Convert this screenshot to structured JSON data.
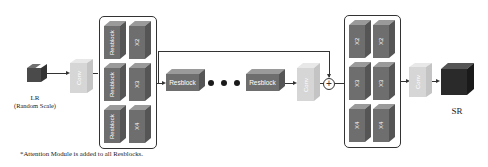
{
  "diagram": {
    "input": {
      "label": "LR",
      "sublabel": "(Random Scale)"
    },
    "head_conv": {
      "label": "Conv"
    },
    "left_group": {
      "rows": [
        {
          "block": "Resblock",
          "scale": "X2"
        },
        {
          "block": "Resblock",
          "scale": "X3"
        },
        {
          "block": "Resblock",
          "scale": "X4"
        }
      ]
    },
    "body": {
      "first_block": "Resblock",
      "last_block": "Resblock",
      "ellipsis_dots": 3,
      "conv": "Conv",
      "sum_symbol": "+"
    },
    "right_group": {
      "rows": [
        {
          "left": "X2",
          "right": "X2"
        },
        {
          "left": "X3",
          "right": "X3"
        },
        {
          "left": "X4",
          "right": "X4"
        }
      ]
    },
    "tail_conv": {
      "label": "Conv"
    },
    "output": {
      "label": "SR"
    },
    "footnote": "*Attention Module is added to all Resblocks."
  },
  "colors": {
    "block_front": "#6e6e6e",
    "block_top": "#9a9a9a",
    "block_side": "#555555",
    "conv_front": "#d6d6d6",
    "conv_top": "#e8e8e8",
    "conv_side": "#c4c4c4",
    "lr_cube": "#4a4a4a",
    "sr_cube": "#2a2a2a",
    "line": "#333333"
  }
}
